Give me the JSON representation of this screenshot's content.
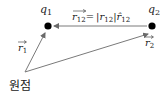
{
  "diagram": {
    "charges": [
      {
        "id": "q1",
        "name": "q",
        "sub": "1"
      },
      {
        "id": "q2",
        "name": "q",
        "sub": "2"
      }
    ],
    "vectors": {
      "r1": {
        "name": "r",
        "sub": "1"
      },
      "r2": {
        "name": "r",
        "sub": "2"
      },
      "r12": {
        "name": "r",
        "sub": "12",
        "equation_eq": "=",
        "magnitude_open": "|",
        "magnitude_name": "r",
        "magnitude_sub": "12",
        "magnitude_close": "|",
        "unit_name": "r̂",
        "unit_sub": "12"
      }
    },
    "origin_label": "원점",
    "colors": {
      "arrow": "#7a7a7a",
      "dot": "#000000",
      "text": "#222222"
    }
  }
}
